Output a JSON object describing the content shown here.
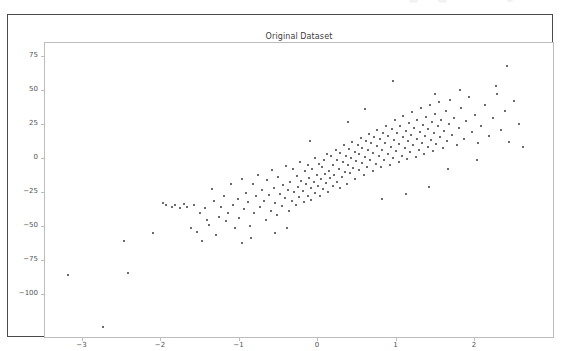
{
  "figure": {
    "background_color": "#ffffff",
    "border_color": "#4a4a4a",
    "axes_frame_color": "#bdbdbd",
    "marker_color": "#3a3a42",
    "tick_label_color": "#555555",
    "title_color": "#3c3c3c"
  },
  "chart_data": {
    "type": "scatter",
    "title": "Original Dataset",
    "xlabel": "",
    "ylabel": "",
    "grid": false,
    "legend": null,
    "xlim": [
      -3.45,
      2.65
    ],
    "ylim": [
      -118,
      88
    ],
    "xticks": [
      -3,
      -2,
      -1,
      0,
      1,
      2
    ],
    "xtick_labels": [
      "−3",
      "−2",
      "−1",
      "0",
      "1",
      "2"
    ],
    "yticks": [
      75,
      50,
      25,
      0,
      -25,
      -50,
      -75,
      -100
    ],
    "ytick_labels": [
      "75",
      "50",
      "25",
      "0",
      "−25",
      "−50",
      "−75",
      "−100"
    ],
    "marker_size": 2,
    "n_points": 232,
    "points": [
      [
        -3.26,
        -75.5
      ],
      [
        -2.82,
        -114.0
      ],
      [
        -2.55,
        -51.0
      ],
      [
        -2.5,
        -74.5
      ],
      [
        -2.18,
        -45.0
      ],
      [
        -2.05,
        -22.5
      ],
      [
        -2.01,
        -24.5
      ],
      [
        -1.93,
        -26.0
      ],
      [
        -1.9,
        -24.0
      ],
      [
        -1.83,
        -26.5
      ],
      [
        -1.78,
        -23.5
      ],
      [
        -1.74,
        -25.5
      ],
      [
        -1.7,
        -41.5
      ],
      [
        -1.66,
        -24.0
      ],
      [
        -1.62,
        -44.0
      ],
      [
        -1.58,
        -30.0
      ],
      [
        -1.55,
        -50.5
      ],
      [
        -1.52,
        -26.5
      ],
      [
        -1.49,
        -35.0
      ],
      [
        -1.46,
        -39.0
      ],
      [
        -1.43,
        -12.5
      ],
      [
        -1.4,
        -21.0
      ],
      [
        -1.37,
        -46.0
      ],
      [
        -1.34,
        -33.0
      ],
      [
        -1.31,
        -25.5
      ],
      [
        -1.28,
        -17.5
      ],
      [
        -1.25,
        -36.0
      ],
      [
        -1.22,
        -30.5
      ],
      [
        -1.19,
        -9.0
      ],
      [
        -1.16,
        -24.0
      ],
      [
        -1.13,
        -41.0
      ],
      [
        -1.1,
        -19.5
      ],
      [
        -1.08,
        -33.5
      ],
      [
        -1.05,
        -5.5
      ],
      [
        -1.02,
        -27.0
      ],
      [
        -0.99,
        -15.5
      ],
      [
        -0.97,
        -22.0
      ],
      [
        -0.94,
        -39.5
      ],
      [
        -0.91,
        -8.5
      ],
      [
        -0.89,
        -30.0
      ],
      [
        -0.86,
        -18.0
      ],
      [
        -0.84,
        -2.5
      ],
      [
        -0.81,
        -26.0
      ],
      [
        -0.79,
        -13.0
      ],
      [
        -0.77,
        -21.5
      ],
      [
        -0.74,
        -35.0
      ],
      [
        -0.72,
        -6.0
      ],
      [
        -0.7,
        -17.0
      ],
      [
        -0.68,
        -28.5
      ],
      [
        -0.66,
        1.5
      ],
      [
        -0.64,
        -11.5
      ],
      [
        -0.62,
        -23.0
      ],
      [
        -0.6,
        -31.5
      ],
      [
        -0.58,
        -4.0
      ],
      [
        -0.56,
        -16.0
      ],
      [
        -0.54,
        -25.0
      ],
      [
        -0.52,
        -9.5
      ],
      [
        -0.5,
        -19.0
      ],
      [
        -0.48,
        4.5
      ],
      [
        -0.46,
        -13.5
      ],
      [
        -0.45,
        -29.0
      ],
      [
        -0.43,
        -7.0
      ],
      [
        -0.41,
        -21.0
      ],
      [
        -0.4,
        2.0
      ],
      [
        -0.38,
        -15.0
      ],
      [
        -0.36,
        -24.5
      ],
      [
        -0.35,
        -3.0
      ],
      [
        -0.33,
        -11.0
      ],
      [
        -0.32,
        -18.5
      ],
      [
        -0.3,
        7.5
      ],
      [
        -0.29,
        -6.5
      ],
      [
        -0.27,
        -14.0
      ],
      [
        -0.26,
        -22.0
      ],
      [
        -0.24,
        0.5
      ],
      [
        -0.23,
        -9.0
      ],
      [
        -0.21,
        -17.5
      ],
      [
        -0.2,
        5.5
      ],
      [
        -0.19,
        -4.5
      ],
      [
        -0.17,
        -12.0
      ],
      [
        -0.16,
        -20.5
      ],
      [
        -0.15,
        2.5
      ],
      [
        -0.13,
        -7.5
      ],
      [
        -0.12,
        10.0
      ],
      [
        -0.11,
        -15.5
      ],
      [
        -0.09,
        -2.0
      ],
      [
        -0.08,
        -10.5
      ],
      [
        -0.07,
        6.0
      ],
      [
        -0.05,
        -18.0
      ],
      [
        -0.04,
        -5.0
      ],
      [
        -0.03,
        3.5
      ],
      [
        -0.01,
        -12.5
      ],
      [
        0.0,
        8.5
      ],
      [
        0.01,
        -1.5
      ],
      [
        0.03,
        -8.0
      ],
      [
        0.04,
        13.0
      ],
      [
        0.05,
        -15.0
      ],
      [
        0.07,
        1.0
      ],
      [
        0.08,
        -4.5
      ],
      [
        0.09,
        11.5
      ],
      [
        0.11,
        -10.0
      ],
      [
        0.12,
        5.0
      ],
      [
        0.13,
        -2.0
      ],
      [
        0.15,
        16.0
      ],
      [
        0.16,
        -7.0
      ],
      [
        0.17,
        9.0
      ],
      [
        0.19,
        2.5
      ],
      [
        0.2,
        -12.0
      ],
      [
        0.21,
        14.0
      ],
      [
        0.23,
        -4.0
      ],
      [
        0.24,
        7.5
      ],
      [
        0.25,
        19.5
      ],
      [
        0.27,
        0.0
      ],
      [
        0.28,
        12.0
      ],
      [
        0.29,
        -8.5
      ],
      [
        0.31,
        5.5
      ],
      [
        0.32,
        17.0
      ],
      [
        0.33,
        -1.0
      ],
      [
        0.35,
        10.5
      ],
      [
        0.36,
        22.0
      ],
      [
        0.37,
        3.0
      ],
      [
        0.39,
        15.0
      ],
      [
        0.4,
        -5.5
      ],
      [
        0.41,
        8.0
      ],
      [
        0.43,
        20.0
      ],
      [
        0.44,
        1.5
      ],
      [
        0.45,
        13.5
      ],
      [
        0.47,
        25.0
      ],
      [
        0.48,
        6.5
      ],
      [
        0.49,
        18.0
      ],
      [
        0.51,
        -2.5
      ],
      [
        0.52,
        11.0
      ],
      [
        0.53,
        23.0
      ],
      [
        0.55,
        4.0
      ],
      [
        0.56,
        16.5
      ],
      [
        0.57,
        28.0
      ],
      [
        0.59,
        9.0
      ],
      [
        0.6,
        21.0
      ],
      [
        0.62,
        1.0
      ],
      [
        0.63,
        14.0
      ],
      [
        0.64,
        26.0
      ],
      [
        0.66,
        6.0
      ],
      [
        0.67,
        19.0
      ],
      [
        0.68,
        31.0
      ],
      [
        0.7,
        11.5
      ],
      [
        0.71,
        24.0
      ],
      [
        0.73,
        3.5
      ],
      [
        0.74,
        16.0
      ],
      [
        0.75,
        29.0
      ],
      [
        0.77,
        8.5
      ],
      [
        0.78,
        21.5
      ],
      [
        0.79,
        34.0
      ],
      [
        0.81,
        13.0
      ],
      [
        0.82,
        26.5
      ],
      [
        0.84,
        5.0
      ],
      [
        0.85,
        18.5
      ],
      [
        0.86,
        31.5
      ],
      [
        0.88,
        10.0
      ],
      [
        0.89,
        23.5
      ],
      [
        0.9,
        38.0
      ],
      [
        0.92,
        15.5
      ],
      [
        0.93,
        28.5
      ],
      [
        0.95,
        7.0
      ],
      [
        0.96,
        20.5
      ],
      [
        0.97,
        33.5
      ],
      [
        0.99,
        12.0
      ],
      [
        1.0,
        25.5
      ],
      [
        1.01,
        41.0
      ],
      [
        1.03,
        17.5
      ],
      [
        1.04,
        30.5
      ],
      [
        1.06,
        9.5
      ],
      [
        1.07,
        22.5
      ],
      [
        1.08,
        36.0
      ],
      [
        1.1,
        14.5
      ],
      [
        1.11,
        27.5
      ],
      [
        1.12,
        44.0
      ],
      [
        1.14,
        19.5
      ],
      [
        1.15,
        32.5
      ],
      [
        1.17,
        11.0
      ],
      [
        1.18,
        24.5
      ],
      [
        1.19,
        38.5
      ],
      [
        1.21,
        16.5
      ],
      [
        1.22,
        29.5
      ],
      [
        1.23,
        47.0
      ],
      [
        1.25,
        21.5
      ],
      [
        1.26,
        34.5
      ],
      [
        1.28,
        13.5
      ],
      [
        1.29,
        26.5
      ],
      [
        1.3,
        40.5
      ],
      [
        1.32,
        18.5
      ],
      [
        1.33,
        31.5
      ],
      [
        1.35,
        49.0
      ],
      [
        1.36,
        23.5
      ],
      [
        1.37,
        36.5
      ],
      [
        1.39,
        15.5
      ],
      [
        1.4,
        28.5
      ],
      [
        1.42,
        43.0
      ],
      [
        1.43,
        20.5
      ],
      [
        1.45,
        33.5
      ],
      [
        1.46,
        51.5
      ],
      [
        1.48,
        25.5
      ],
      [
        1.49,
        38.5
      ],
      [
        1.51,
        17.5
      ],
      [
        1.53,
        30.0
      ],
      [
        1.55,
        45.0
      ],
      [
        1.57,
        22.5
      ],
      [
        1.59,
        35.5
      ],
      [
        1.61,
        53.0
      ],
      [
        1.63,
        27.5
      ],
      [
        1.66,
        40.0
      ],
      [
        1.69,
        19.5
      ],
      [
        1.72,
        32.0
      ],
      [
        1.75,
        47.0
      ],
      [
        1.78,
        24.5
      ],
      [
        1.81,
        37.5
      ],
      [
        1.85,
        55.0
      ],
      [
        1.88,
        29.5
      ],
      [
        1.92,
        42.0
      ],
      [
        1.96,
        21.5
      ],
      [
        2.0,
        34.0
      ],
      [
        2.05,
        49.5
      ],
      [
        2.1,
        26.5
      ],
      [
        2.15,
        39.5
      ],
      [
        2.2,
        57.0
      ],
      [
        2.25,
        31.0
      ],
      [
        2.31,
        44.5
      ],
      [
        2.36,
        22.0
      ],
      [
        2.42,
        52.0
      ],
      [
        2.48,
        35.0
      ],
      [
        2.53,
        18.5
      ],
      [
        0.88,
        67.0
      ],
      [
        2.33,
        78.0
      ],
      [
        1.73,
        60.0
      ],
      [
        2.19,
        63.5
      ],
      [
        1.42,
        57.5
      ],
      [
        0.52,
        46.0
      ],
      [
        0.31,
        36.5
      ],
      [
        -0.18,
        23.0
      ],
      [
        1.05,
        -16.5
      ],
      [
        1.34,
        -11.0
      ],
      [
        0.74,
        -19.5
      ],
      [
        1.58,
        2.0
      ],
      [
        1.95,
        9.0
      ],
      [
        -0.62,
        -44.5
      ],
      [
        -0.93,
        -48.5
      ],
      [
        -0.47,
        -41.0
      ],
      [
        -1.04,
        -52.0
      ]
    ]
  },
  "axes_geometry": {
    "left_px": 36,
    "top_px": 27,
    "width_px": 510,
    "height_px": 296,
    "x_origin_px": 316,
    "x_unit_px": 78.5,
    "y_origin_px": 157,
    "y_unit_px": 1.36
  }
}
